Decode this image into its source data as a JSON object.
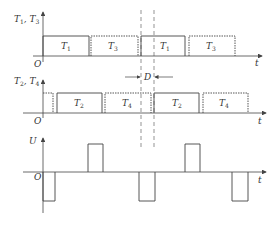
{
  "diagram": {
    "type": "timing-diagram",
    "plots": [
      {
        "name": "T1-T3",
        "y_label": "T1, T3",
        "x_label": "t",
        "origin": "O",
        "pulses": [
          {
            "label": "T1",
            "style": "solid"
          },
          {
            "label": "T3",
            "style": "dotted"
          },
          {
            "label": "T1",
            "style": "solid"
          },
          {
            "label": "T3",
            "style": "dotted"
          }
        ]
      },
      {
        "name": "T2-T4",
        "y_label": "T2, T4",
        "x_label": "t",
        "origin": "O",
        "pulses": [
          {
            "label": "T2",
            "style": "solid"
          },
          {
            "label": "T4",
            "style": "dotted"
          },
          {
            "label": "T2",
            "style": "solid"
          },
          {
            "label": "T4",
            "style": "dotted"
          }
        ]
      },
      {
        "name": "U",
        "y_label": "U",
        "x_label": "t",
        "origin": "O",
        "pulses": [
          "negative",
          "positive",
          "negative",
          "positive",
          "negative"
        ]
      }
    ],
    "phase_shift_label": "D"
  },
  "labels": {
    "p1_y_main": "T",
    "p1_y_sub1": "1",
    "p1_y_sep": " , T",
    "p1_y_sub2": "3",
    "p2_y_sub1": "2",
    "p2_y_sub2": "4",
    "p3_y": "U",
    "origin": "O",
    "t": "t",
    "D": "D",
    "T": "T",
    "s1": "1",
    "s2": "2",
    "s3": "3",
    "s4": "4"
  }
}
